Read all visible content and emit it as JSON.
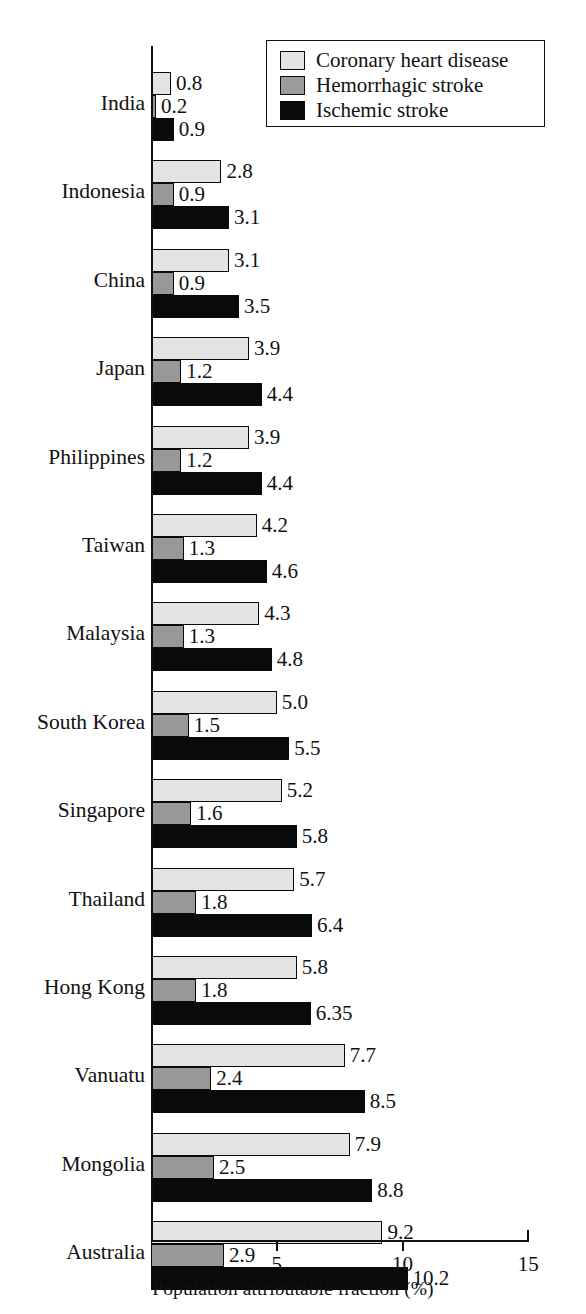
{
  "chart_data": {
    "type": "bar",
    "orientation": "horizontal",
    "title": "",
    "xlabel": "Population attributable fraction (%)",
    "ylabel": "",
    "xlim": [
      0,
      15
    ],
    "xticks": [
      5,
      10,
      15
    ],
    "xtick_labels": [
      "5",
      "10",
      "15"
    ],
    "grid": false,
    "legend_position": "top-right",
    "categories": [
      "India",
      "Indonesia",
      "China",
      "Japan",
      "Philippines",
      "Taiwan",
      "Malaysia",
      "South Korea",
      "Singapore",
      "Thailand",
      "Hong Kong",
      "Vanuatu",
      "Mongolia",
      "Australia"
    ],
    "series": [
      {
        "name": "Coronary heart disease",
        "color": "#e3e3e3",
        "values": [
          0.8,
          2.8,
          3.1,
          3.9,
          3.9,
          4.2,
          4.3,
          5.0,
          5.2,
          5.7,
          5.8,
          7.7,
          7.9,
          9.2
        ],
        "labels": [
          "0.8",
          "2.8",
          "3.1",
          "3.9",
          "3.9",
          "4.2",
          "4.3",
          "5.0",
          "5.2",
          "5.7",
          "5.8",
          "7.7",
          "7.9",
          "9.2"
        ]
      },
      {
        "name": "Hemorrhagic stroke",
        "color": "#989898",
        "values": [
          0.2,
          0.9,
          0.9,
          1.2,
          1.2,
          1.3,
          1.3,
          1.5,
          1.6,
          1.8,
          1.8,
          2.4,
          2.5,
          2.9
        ],
        "labels": [
          "0.2",
          "0.9",
          "0.9",
          "1.2",
          "1.2",
          "1.3",
          "1.3",
          "1.5",
          "1.6",
          "1.8",
          "1.8",
          "2.4",
          "2.5",
          "2.9"
        ]
      },
      {
        "name": "Ischemic stroke",
        "color": "#0a0a0a",
        "values": [
          0.9,
          3.1,
          3.5,
          4.4,
          4.4,
          4.6,
          4.8,
          5.5,
          5.8,
          6.4,
          6.35,
          8.5,
          8.8,
          10.2
        ],
        "labels": [
          "0.9",
          "3.1",
          "3.5",
          "4.4",
          "4.4",
          "4.6",
          "4.8",
          "5.5",
          "5.8",
          "6.4",
          "6.35",
          "8.5",
          "8.8",
          "10.2"
        ]
      }
    ]
  },
  "legend": {
    "items": [
      {
        "label": "Coronary heart disease",
        "swatch": "s0"
      },
      {
        "label": "Hemorrhagic stroke",
        "swatch": "s1"
      },
      {
        "label": "Ischemic stroke",
        "swatch": "s2"
      }
    ]
  }
}
